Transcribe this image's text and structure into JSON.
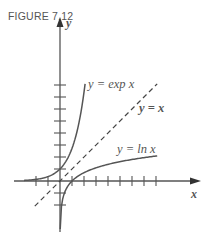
{
  "figure": {
    "label": "FIGURE 7.12"
  },
  "chart_data": {
    "type": "line",
    "title": "FIGURE 7.12",
    "xlabel": "x",
    "ylabel": "y",
    "grid": false,
    "legend": "none",
    "xlim": [
      -2,
      8
    ],
    "ylim": [
      -4,
      12
    ],
    "x_ticks": [
      -2,
      -1,
      1,
      2,
      3,
      4,
      5,
      6,
      7,
      8
    ],
    "y_ticks": [
      -2,
      -1,
      1,
      2,
      3,
      4,
      5,
      6,
      7,
      8
    ],
    "series": [
      {
        "name": "y = exp x",
        "style": "solid",
        "x": [
          -3,
          -2,
          -1,
          0,
          1,
          1.5,
          2,
          2.2
        ],
        "y": [
          0.05,
          0.14,
          0.37,
          1,
          2.72,
          4.48,
          7.39,
          9.0
        ]
      },
      {
        "name": "y = x",
        "style": "dashed",
        "x": [
          -2,
          8
        ],
        "y": [
          -2,
          8
        ]
      },
      {
        "name": "y = ln x",
        "style": "solid",
        "x": [
          0.05,
          0.14,
          0.37,
          1,
          2,
          4,
          6,
          8
        ],
        "y": [
          -3.0,
          -2.0,
          -1.0,
          0,
          0.69,
          1.39,
          1.79,
          2.08
        ]
      }
    ],
    "annotations": [
      "y = exp x",
      "y = x",
      "y = ln x"
    ]
  },
  "labels": {
    "exp": "y = exp x",
    "identity": "y = x",
    "ln": "y = ln x",
    "x_axis": "x",
    "y_axis": "y"
  }
}
